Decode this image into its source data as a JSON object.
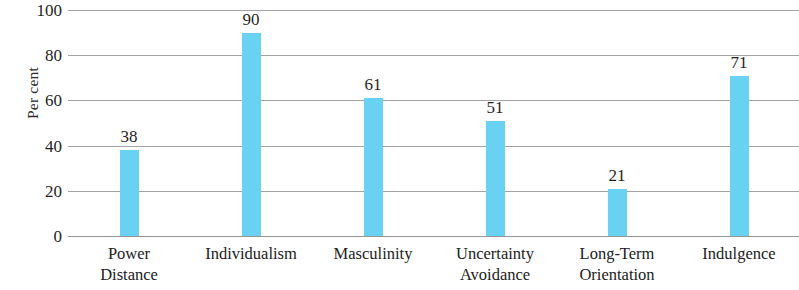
{
  "chart_data": {
    "type": "bar",
    "title": "",
    "subtitle": "",
    "xlabel": "",
    "ylabel": "Per cent",
    "categories": [
      "Power Distance",
      "Individualism",
      "Masculinity",
      "Uncertainty Avoidance",
      "Long-Term Orientation",
      "Indulgence"
    ],
    "category_lines": [
      [
        "Power",
        "Distance"
      ],
      [
        "Individualism"
      ],
      [
        "Masculinity"
      ],
      [
        "Uncertainty",
        "Avoidance"
      ],
      [
        "Long-Term",
        "Orientation"
      ],
      [
        "Indulgence"
      ]
    ],
    "values": [
      38,
      90,
      61,
      51,
      21,
      71
    ],
    "data_labels": [
      "38",
      "90",
      "61",
      "51",
      "21",
      "71"
    ],
    "ylim": [
      0,
      100
    ],
    "y_ticks": [
      100,
      80,
      60,
      40,
      20,
      0
    ],
    "y_tick_labels": [
      "100",
      "80",
      "60",
      "40",
      "20",
      "0"
    ],
    "grid": true,
    "grid_axis": "y",
    "legend": false,
    "legend_position": "none",
    "bar_color": "#69d2f2",
    "gridline_color": "#8e8e8e",
    "text_color": "#1f1f1f",
    "background_color": "#ffffff"
  }
}
